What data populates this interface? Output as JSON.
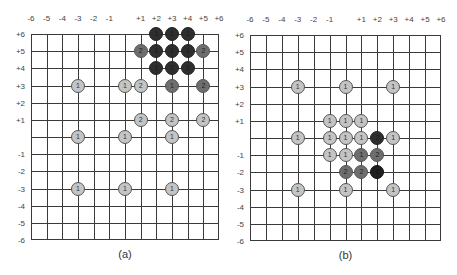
{
  "axes": {
    "x_labels": [
      "-6",
      "-5",
      "-4",
      "-3",
      "-2",
      "-1",
      "",
      "+1",
      "+2",
      "+3",
      "+4",
      "+5",
      "+6"
    ],
    "y_labels": [
      "+6",
      "+5",
      "+4",
      "+3",
      "+2",
      "+1",
      "",
      "-1",
      "-2",
      "-3",
      "-4",
      "-5",
      "-6"
    ]
  },
  "panels": [
    {
      "caption": "(a)",
      "grid": {
        "left": 31,
        "top": 34,
        "width": 188,
        "height": 206
      },
      "dots": [
        {
          "x": 2,
          "y": 6,
          "label": "1",
          "shade": "dark"
        },
        {
          "x": 3,
          "y": 6,
          "label": "1",
          "shade": "dark"
        },
        {
          "x": 4,
          "y": 6,
          "label": "1",
          "shade": "dark"
        },
        {
          "x": 1,
          "y": 5,
          "label": "2",
          "shade": "medium"
        },
        {
          "x": 2,
          "y": 5,
          "label": "1",
          "shade": "dark"
        },
        {
          "x": 3,
          "y": 5,
          "label": "1",
          "shade": "dark"
        },
        {
          "x": 4,
          "y": 5,
          "label": "1",
          "shade": "dark"
        },
        {
          "x": 5,
          "y": 5,
          "label": "2",
          "shade": "medium"
        },
        {
          "x": 2,
          "y": 4,
          "label": "1",
          "shade": "dark"
        },
        {
          "x": 3,
          "y": 4,
          "label": "2",
          "shade": "dark"
        },
        {
          "x": 4,
          "y": 4,
          "label": "3",
          "shade": "dark"
        },
        {
          "x": -3,
          "y": 3,
          "label": "1",
          "shade": "light"
        },
        {
          "x": 0,
          "y": 3,
          "label": "1",
          "shade": "light"
        },
        {
          "x": 1,
          "y": 3,
          "label": "2",
          "shade": "light"
        },
        {
          "x": 3,
          "y": 3,
          "label": "1",
          "shade": "medium"
        },
        {
          "x": 5,
          "y": 3,
          "label": "2",
          "shade": "medium"
        },
        {
          "x": 1,
          "y": 1,
          "label": "2",
          "shade": "light"
        },
        {
          "x": 3,
          "y": 1,
          "label": "2",
          "shade": "light"
        },
        {
          "x": 5,
          "y": 1,
          "label": "2",
          "shade": "light"
        },
        {
          "x": -3,
          "y": 0,
          "label": "1",
          "shade": "light"
        },
        {
          "x": 0,
          "y": 0,
          "label": "1",
          "shade": "light"
        },
        {
          "x": 3,
          "y": 0,
          "label": "1",
          "shade": "light"
        },
        {
          "x": -3,
          "y": -3,
          "label": "1",
          "shade": "light"
        },
        {
          "x": 0,
          "y": -3,
          "label": "1",
          "shade": "light"
        },
        {
          "x": 3,
          "y": -3,
          "label": "1",
          "shade": "light"
        }
      ]
    },
    {
      "caption": "(b)",
      "grid": {
        "left": 250,
        "top": 35,
        "width": 191,
        "height": 206
      },
      "dots": [
        {
          "x": -3,
          "y": 3,
          "label": "1",
          "shade": "light"
        },
        {
          "x": 0,
          "y": 3,
          "label": "1",
          "shade": "light"
        },
        {
          "x": 3,
          "y": 3,
          "label": "1",
          "shade": "light"
        },
        {
          "x": -1,
          "y": 1,
          "label": "1",
          "shade": "light"
        },
        {
          "x": 0,
          "y": 1,
          "label": "1",
          "shade": "light"
        },
        {
          "x": 1,
          "y": 1,
          "label": "1",
          "shade": "light"
        },
        {
          "x": -3,
          "y": 0,
          "label": "1",
          "shade": "light"
        },
        {
          "x": -1,
          "y": 0,
          "label": "1",
          "shade": "light"
        },
        {
          "x": 0,
          "y": 0,
          "label": "1",
          "shade": "light"
        },
        {
          "x": 1,
          "y": 0,
          "label": "1",
          "shade": "light"
        },
        {
          "x": 2,
          "y": 0,
          "label": "2",
          "shade": "dark"
        },
        {
          "x": 3,
          "y": 0,
          "label": "1",
          "shade": "light"
        },
        {
          "x": -1,
          "y": -1,
          "label": "1",
          "shade": "light"
        },
        {
          "x": 0,
          "y": -1,
          "label": "1",
          "shade": "light"
        },
        {
          "x": 1,
          "y": -1,
          "label": "1",
          "shade": "medium"
        },
        {
          "x": 2,
          "y": -1,
          "label": "2",
          "shade": "medium"
        },
        {
          "x": 0,
          "y": -2,
          "label": "2",
          "shade": "medium"
        },
        {
          "x": 1,
          "y": -2,
          "label": "2",
          "shade": "medium"
        },
        {
          "x": 2,
          "y": -2,
          "label": "2",
          "shade": "darkest"
        },
        {
          "x": -3,
          "y": -3,
          "label": "1",
          "shade": "light"
        },
        {
          "x": 0,
          "y": -3,
          "label": "1",
          "shade": "light"
        },
        {
          "x": 3,
          "y": -3,
          "label": "1",
          "shade": "light"
        }
      ]
    }
  ],
  "colors": {
    "light": "#c4c4c4",
    "medium": "#6e6e6e",
    "dark": "#2e2e2e",
    "darkest": "#1f1f1f",
    "grid": "#3a3a3a"
  }
}
